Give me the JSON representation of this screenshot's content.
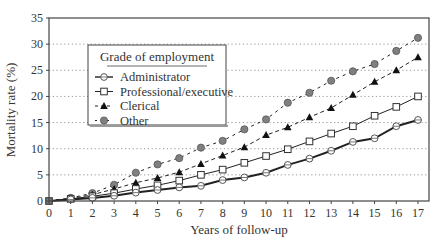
{
  "chart_data": {
    "type": "line",
    "title": "",
    "xlabel": "Years of follow-up",
    "ylabel": "Mortality rate (%)",
    "x": [
      0,
      1,
      2,
      3,
      4,
      5,
      6,
      7,
      8,
      9,
      10,
      11,
      12,
      13,
      14,
      15,
      16,
      17
    ],
    "xlim": [
      0,
      17
    ],
    "ylim": [
      0,
      35
    ],
    "yticks": [
      0,
      5,
      10,
      15,
      20,
      25,
      30,
      35
    ],
    "xticks": [
      0,
      1,
      2,
      3,
      4,
      5,
      6,
      7,
      8,
      9,
      10,
      11,
      12,
      13,
      14,
      15,
      16,
      17
    ],
    "grid": "horizontal dotted",
    "legend": {
      "title": "Grade of employment",
      "position": "upper left",
      "entries": [
        "Administrator",
        "Professional/executive",
        "Clerical",
        "Other"
      ]
    },
    "series": [
      {
        "name": "Administrator",
        "marker": "circle-open-cross",
        "line": "solid-thick",
        "values": [
          0,
          0.3,
          0.6,
          1.0,
          1.6,
          2.1,
          2.6,
          2.9,
          4.0,
          4.5,
          5.4,
          6.9,
          8.1,
          9.6,
          11.3,
          12.0,
          14.3,
          15.5
        ]
      },
      {
        "name": "Professional/executive",
        "marker": "square-open",
        "line": "solid-thin",
        "values": [
          0,
          0.4,
          0.9,
          1.5,
          2.3,
          3.0,
          3.9,
          5.0,
          6.0,
          7.3,
          8.6,
          9.9,
          11.4,
          12.9,
          14.3,
          16.3,
          18.0,
          20.0
        ]
      },
      {
        "name": "Clerical",
        "marker": "triangle-filled",
        "line": "dashed",
        "values": [
          0,
          0.5,
          1.2,
          2.3,
          3.5,
          4.4,
          5.5,
          7.1,
          8.7,
          10.3,
          12.6,
          14.1,
          16.0,
          17.8,
          20.3,
          22.8,
          25.0,
          27.5
        ]
      },
      {
        "name": "Other",
        "marker": "circle-filled-gray",
        "line": "dotted-dashed",
        "values": [
          0,
          0.6,
          1.5,
          3.1,
          5.4,
          7.0,
          8.2,
          10.2,
          11.5,
          13.7,
          15.6,
          18.8,
          20.7,
          23.0,
          24.8,
          26.2,
          28.7,
          31.2
        ]
      }
    ]
  },
  "colors": {
    "axis": "#444444",
    "grid": "#8a8a8a",
    "line": "#222222",
    "other_marker": "#808080",
    "text": "#333333"
  }
}
